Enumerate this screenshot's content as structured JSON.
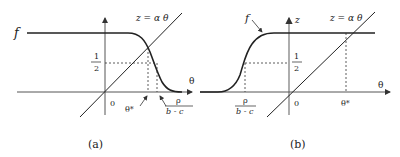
{
  "panels": [
    {
      "caption": "(a)",
      "curve_label": "f",
      "line_label": "z = α θ",
      "half_num": "1",
      "half_den": "2",
      "x_axis_label": "θ",
      "origin_label": "0",
      "theta_star_label": "θ*",
      "rho_num": "ρ",
      "rho_den": "b - c"
    },
    {
      "caption": "(b)",
      "curve_label": "f",
      "y_axis_label": "z",
      "line_label": "z = α θ",
      "half_num": "1",
      "half_den": "2",
      "x_axis_label": "θ",
      "origin_label": "0",
      "theta_star_label": "θ*",
      "rho_num": "ρ",
      "rho_den": "b - c"
    }
  ]
}
